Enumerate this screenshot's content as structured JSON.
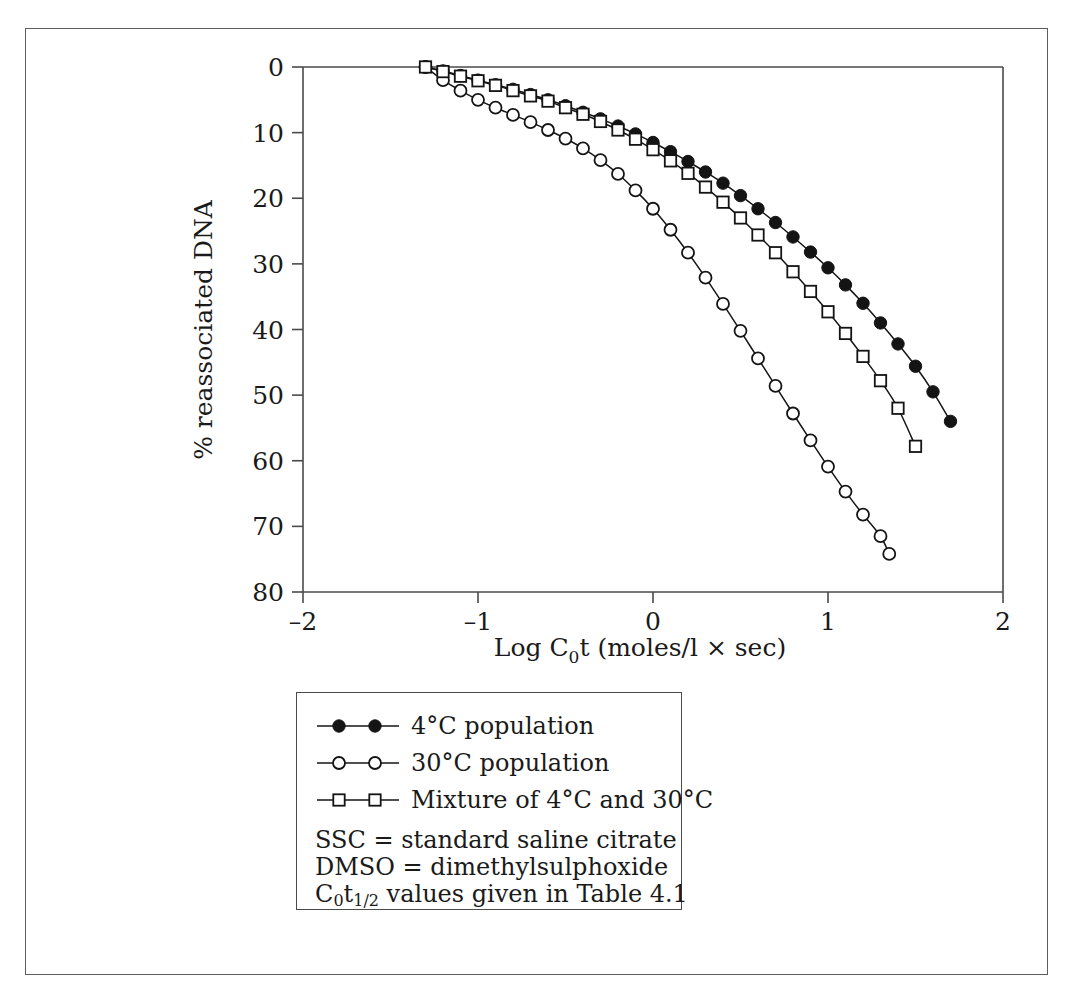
{
  "figure": {
    "has_outer_border": true,
    "background_color": "#ffffff",
    "ink_color": "#1a1a1a"
  },
  "axes": {
    "x_title_prefix": "Log C",
    "x_title_sub": "0",
    "x_title_suffix": "t (moles/l × sec)",
    "x_title_full": "Log C0t (moles/l × sec)",
    "y_title": "% reassociated DNA",
    "x_ticks": [
      "–2",
      "–1",
      "0",
      "1",
      "2"
    ],
    "x_tick_values": [
      -2,
      -1,
      0,
      1,
      2
    ],
    "y_ticks": [
      "0",
      "10",
      "20",
      "30",
      "40",
      "50",
      "60",
      "70",
      "80"
    ],
    "y_tick_values": [
      0,
      10,
      20,
      30,
      40,
      50,
      60,
      70,
      80
    ]
  },
  "legend": {
    "entries": [
      {
        "label": "4°C population",
        "marker": "filled-circle",
        "series_key": "pop_4c"
      },
      {
        "label": "30°C population",
        "marker": "open-circle",
        "series_key": "pop_30c"
      },
      {
        "label": "Mixture of 4°C and 30°C",
        "marker": "open-square",
        "series_key": "mixture"
      }
    ],
    "notes": [
      {
        "text": "SSC = standard saline citrate",
        "has_subscript": false
      },
      {
        "text": "DMSO = dimethylsulphoxide",
        "has_subscript": false
      },
      {
        "text": "C0t1/2 values given in Table 4.1",
        "has_subscript": true,
        "prefix": "C",
        "sub1": "0",
        "mid": "t",
        "sub2": "1/2",
        "suffix": " values given in Table 4.1"
      }
    ]
  },
  "chart_data": {
    "type": "line",
    "title": "",
    "xlabel": "Log C0t (moles/l × sec)",
    "ylabel": "% reassociated DNA",
    "xlim": [
      -2,
      2
    ],
    "ylim": [
      0,
      80
    ],
    "y_axis_inverted": true,
    "grid": false,
    "legend_position": "below-plot",
    "series": [
      {
        "name": "4°C population",
        "marker": "filled-circle",
        "x": [
          -1.3,
          -1.2,
          -1.1,
          -1.0,
          -0.9,
          -0.8,
          -0.7,
          -0.6,
          -0.5,
          -0.4,
          -0.3,
          -0.2,
          -0.1,
          0.0,
          0.1,
          0.2,
          0.3,
          0.4,
          0.5,
          0.6,
          0.7,
          0.8,
          0.9,
          1.0,
          1.1,
          1.2,
          1.3,
          1.4,
          1.5,
          1.6,
          1.7
        ],
        "y": [
          0.0,
          0.6,
          1.3,
          2.0,
          2.7,
          3.4,
          4.2,
          5.0,
          5.9,
          6.9,
          7.9,
          9.0,
          10.2,
          11.5,
          12.9,
          14.4,
          16.0,
          17.7,
          19.6,
          21.6,
          23.7,
          25.9,
          28.2,
          30.6,
          33.2,
          36.0,
          39.0,
          42.2,
          45.6,
          49.5,
          54.0
        ]
      },
      {
        "name": "30°C population",
        "marker": "open-circle",
        "x": [
          -1.3,
          -1.2,
          -1.1,
          -1.0,
          -0.9,
          -0.8,
          -0.7,
          -0.6,
          -0.5,
          -0.4,
          -0.3,
          -0.2,
          -0.1,
          0.0,
          0.1,
          0.2,
          0.3,
          0.4,
          0.5,
          0.6,
          0.7,
          0.8,
          0.9,
          1.0,
          1.1,
          1.2,
          1.3,
          1.35
        ],
        "y": [
          0.0,
          2.0,
          3.6,
          5.0,
          6.2,
          7.3,
          8.4,
          9.6,
          10.9,
          12.4,
          14.2,
          16.3,
          18.8,
          21.6,
          24.8,
          28.3,
          32.1,
          36.1,
          40.2,
          44.4,
          48.6,
          52.8,
          56.9,
          60.9,
          64.7,
          68.2,
          71.5,
          74.2
        ]
      },
      {
        "name": "Mixture of 4°C and 30°C",
        "marker": "open-square",
        "x": [
          -1.3,
          -1.2,
          -1.1,
          -1.0,
          -0.9,
          -0.8,
          -0.7,
          -0.6,
          -0.5,
          -0.4,
          -0.3,
          -0.2,
          -0.1,
          0.0,
          0.1,
          0.2,
          0.3,
          0.4,
          0.5,
          0.6,
          0.7,
          0.8,
          0.9,
          1.0,
          1.1,
          1.2,
          1.3,
          1.4,
          1.5
        ],
        "y": [
          0.0,
          0.7,
          1.4,
          2.1,
          2.8,
          3.6,
          4.4,
          5.2,
          6.2,
          7.2,
          8.3,
          9.6,
          11.0,
          12.6,
          14.3,
          16.2,
          18.3,
          20.6,
          23.0,
          25.6,
          28.3,
          31.2,
          34.2,
          37.3,
          40.6,
          44.1,
          47.8,
          52.0,
          57.8
        ]
      }
    ]
  }
}
